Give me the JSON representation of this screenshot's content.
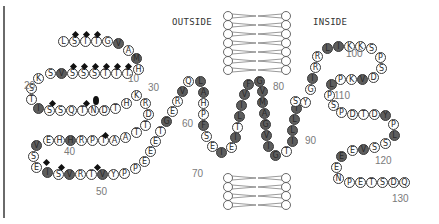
{
  "labels": {
    "outside": "OUTSIDE",
    "inside": "INSIDE"
  },
  "colors": {
    "hydrophobic": "#5e5e5e",
    "residue_fill": "#ffffff",
    "glyco": "#111111",
    "number": "#7a7a7a"
  },
  "numbers": [
    {
      "text": "10",
      "x": 128,
      "y": 79
    },
    {
      "text": "20",
      "x": 24,
      "y": 86
    },
    {
      "text": "30",
      "x": 148,
      "y": 88
    },
    {
      "text": "40",
      "x": 64,
      "y": 152
    },
    {
      "text": "50",
      "x": 96,
      "y": 192
    },
    {
      "text": "60",
      "x": 182,
      "y": 124
    },
    {
      "text": "70",
      "x": 192,
      "y": 174
    },
    {
      "text": "80",
      "x": 273,
      "y": 87
    },
    {
      "text": "90",
      "x": 305,
      "y": 141
    },
    {
      "text": "100",
      "x": 346,
      "y": 54
    },
    {
      "text": "110",
      "x": 334,
      "y": 96
    },
    {
      "text": "120",
      "x": 375,
      "y": 161
    },
    {
      "text": "130",
      "x": 392,
      "y": 199
    }
  ],
  "residues": [
    {
      "aa": "L",
      "x": 63,
      "y": 41,
      "d": 0
    },
    {
      "aa": "S",
      "x": 74,
      "y": 41,
      "d": 0
    },
    {
      "aa": "I",
      "x": 85,
      "y": 41,
      "d": 0
    },
    {
      "aa": "T",
      "x": 96,
      "y": 41,
      "d": 0
    },
    {
      "aa": "G",
      "x": 107,
      "y": 41,
      "d": 0
    },
    {
      "aa": "V",
      "x": 118,
      "y": 43,
      "d": 1
    },
    {
      "aa": "A",
      "x": 128,
      "y": 50,
      "d": 0
    },
    {
      "aa": "M",
      "x": 136,
      "y": 58,
      "d": 1
    },
    {
      "aa": "H",
      "x": 138,
      "y": 69,
      "d": 0
    },
    {
      "aa": "T",
      "x": 127,
      "y": 73,
      "d": 0
    },
    {
      "aa": "T",
      "x": 116,
      "y": 73,
      "d": 0
    },
    {
      "aa": "T",
      "x": 105,
      "y": 73,
      "d": 0
    },
    {
      "aa": "S",
      "x": 94,
      "y": 73,
      "d": 0
    },
    {
      "aa": "S",
      "x": 83,
      "y": 73,
      "d": 0
    },
    {
      "aa": "S",
      "x": 72,
      "y": 73,
      "d": 0
    },
    {
      "aa": "V",
      "x": 61,
      "y": 73,
      "d": 1
    },
    {
      "aa": "S",
      "x": 50,
      "y": 73,
      "d": 0
    },
    {
      "aa": "K",
      "x": 38,
      "y": 78,
      "d": 0
    },
    {
      "aa": "S",
      "x": 31,
      "y": 88,
      "d": 0
    },
    {
      "aa": "T",
      "x": 31,
      "y": 99,
      "d": 0
    },
    {
      "aa": "I",
      "x": 38,
      "y": 108,
      "d": 1
    },
    {
      "aa": "S",
      "x": 49,
      "y": 110,
      "d": 0
    },
    {
      "aa": "S",
      "x": 60,
      "y": 110,
      "d": 0
    },
    {
      "aa": "Q",
      "x": 71,
      "y": 110,
      "d": 0
    },
    {
      "aa": "T",
      "x": 82,
      "y": 110,
      "d": 0
    },
    {
      "aa": "N",
      "x": 93,
      "y": 110,
      "d": 0
    },
    {
      "aa": "D",
      "x": 104,
      "y": 110,
      "d": 0
    },
    {
      "aa": "T",
      "x": 115,
      "y": 108,
      "d": 0
    },
    {
      "aa": "H",
      "x": 126,
      "y": 103,
      "d": 0
    },
    {
      "aa": "K",
      "x": 136,
      "y": 95,
      "d": 0
    },
    {
      "aa": "R",
      "x": 145,
      "y": 103,
      "d": 0
    },
    {
      "aa": "D",
      "x": 148,
      "y": 114,
      "d": 0
    },
    {
      "aa": "T",
      "x": 145,
      "y": 125,
      "d": 0
    },
    {
      "aa": "T",
      "x": 136,
      "y": 132,
      "d": 0
    },
    {
      "aa": "A",
      "x": 125,
      "y": 137,
      "d": 0
    },
    {
      "aa": "A",
      "x": 114,
      "y": 140,
      "d": 0
    },
    {
      "aa": "T",
      "x": 103,
      "y": 140,
      "d": 0
    },
    {
      "aa": "P",
      "x": 92,
      "y": 140,
      "d": 0
    },
    {
      "aa": "R",
      "x": 81,
      "y": 140,
      "d": 0
    },
    {
      "aa": "H",
      "x": 70,
      "y": 140,
      "d": 1
    },
    {
      "aa": "H",
      "x": 59,
      "y": 140,
      "d": 0
    },
    {
      "aa": "E",
      "x": 48,
      "y": 140,
      "d": 0
    },
    {
      "aa": "V",
      "x": 36,
      "y": 145,
      "d": 1
    },
    {
      "aa": "S",
      "x": 33,
      "y": 156,
      "d": 0
    },
    {
      "aa": "E",
      "x": 36,
      "y": 167,
      "d": 0
    },
    {
      "aa": "I",
      "x": 47,
      "y": 172,
      "d": 1
    },
    {
      "aa": "S",
      "x": 58,
      "y": 174,
      "d": 0
    },
    {
      "aa": "V",
      "x": 69,
      "y": 174,
      "d": 1
    },
    {
      "aa": "R",
      "x": 80,
      "y": 174,
      "d": 0
    },
    {
      "aa": "T",
      "x": 91,
      "y": 174,
      "d": 0
    },
    {
      "aa": "V",
      "x": 102,
      "y": 174,
      "d": 1
    },
    {
      "aa": "Y",
      "x": 113,
      "y": 174,
      "d": 0
    },
    {
      "aa": "P",
      "x": 124,
      "y": 173,
      "d": 0
    },
    {
      "aa": "P",
      "x": 135,
      "y": 168,
      "d": 0
    },
    {
      "aa": "E",
      "x": 144,
      "y": 161,
      "d": 0
    },
    {
      "aa": "E",
      "x": 150,
      "y": 151,
      "d": 0
    },
    {
      "aa": "E",
      "x": 155,
      "y": 141,
      "d": 0
    },
    {
      "aa": "T",
      "x": 160,
      "y": 131,
      "d": 0
    },
    {
      "aa": "G",
      "x": 166,
      "y": 121,
      "d": 1
    },
    {
      "aa": "E",
      "x": 172,
      "y": 111,
      "d": 0
    },
    {
      "aa": "R",
      "x": 177,
      "y": 101,
      "d": 0
    },
    {
      "aa": "V",
      "x": 182,
      "y": 91,
      "d": 1
    },
    {
      "aa": "Q",
      "x": 188,
      "y": 81,
      "d": 0
    },
    {
      "aa": "L",
      "x": 200,
      "y": 81,
      "d": 1
    },
    {
      "aa": "A",
      "x": 203,
      "y": 92,
      "d": 1
    },
    {
      "aa": "H",
      "x": 203,
      "y": 103,
      "d": 0
    },
    {
      "aa": "P",
      "x": 203,
      "y": 114,
      "d": 0
    },
    {
      "aa": "F",
      "x": 203,
      "y": 125,
      "d": 1
    },
    {
      "aa": "S",
      "x": 206,
      "y": 136,
      "d": 0
    },
    {
      "aa": "E",
      "x": 212,
      "y": 146,
      "d": 0
    },
    {
      "aa": "I",
      "x": 221,
      "y": 152,
      "d": 1
    },
    {
      "aa": "E",
      "x": 231,
      "y": 147,
      "d": 0
    },
    {
      "aa": "I",
      "x": 235,
      "y": 137,
      "d": 1
    },
    {
      "aa": "T",
      "x": 237,
      "y": 127,
      "d": 0
    },
    {
      "aa": "L",
      "x": 239,
      "y": 116,
      "d": 1
    },
    {
      "aa": "I",
      "x": 241,
      "y": 105,
      "d": 1
    },
    {
      "aa": "V",
      "x": 244,
      "y": 94,
      "d": 1
    },
    {
      "aa": "F",
      "x": 248,
      "y": 84,
      "d": 1
    },
    {
      "aa": "G",
      "x": 259,
      "y": 81,
      "d": 1
    },
    {
      "aa": "V",
      "x": 262,
      "y": 91,
      "d": 1
    },
    {
      "aa": "M",
      "x": 262,
      "y": 102,
      "d": 1
    },
    {
      "aa": "A",
      "x": 264,
      "y": 113,
      "d": 1
    },
    {
      "aa": "G",
      "x": 265,
      "y": 124,
      "d": 1
    },
    {
      "aa": "V",
      "x": 266,
      "y": 135,
      "d": 1
    },
    {
      "aa": "I",
      "x": 268,
      "y": 146,
      "d": 1
    },
    {
      "aa": "G",
      "x": 275,
      "y": 155,
      "d": 1
    },
    {
      "aa": "T",
      "x": 286,
      "y": 151,
      "d": 0
    },
    {
      "aa": "I",
      "x": 292,
      "y": 141,
      "d": 1
    },
    {
      "aa": "L",
      "x": 292,
      "y": 130,
      "d": 1
    },
    {
      "aa": "L",
      "x": 294,
      "y": 119,
      "d": 1
    },
    {
      "aa": "I",
      "x": 296,
      "y": 108,
      "d": 1
    },
    {
      "aa": "Y",
      "x": 305,
      "y": 102,
      "d": 0
    },
    {
      "aa": "S",
      "x": 295,
      "y": 101,
      "d": 0
    },
    {
      "aa": "G",
      "x": 310,
      "y": 89,
      "d": 0
    },
    {
      "aa": "I",
      "x": 312,
      "y": 78,
      "d": 1
    },
    {
      "aa": "R",
      "x": 315,
      "y": 67,
      "d": 0
    },
    {
      "aa": "R",
      "x": 317,
      "y": 56,
      "d": 0
    },
    {
      "aa": "L",
      "x": 327,
      "y": 48,
      "d": 1
    },
    {
      "aa": "I",
      "x": 338,
      "y": 46,
      "d": 1
    },
    {
      "aa": "K",
      "x": 349,
      "y": 46,
      "d": 0
    },
    {
      "aa": "K",
      "x": 360,
      "y": 46,
      "d": 0
    },
    {
      "aa": "S",
      "x": 371,
      "y": 48,
      "d": 0
    },
    {
      "aa": "P",
      "x": 380,
      "y": 57,
      "d": 0
    },
    {
      "aa": "S",
      "x": 381,
      "y": 68,
      "d": 0
    },
    {
      "aa": "D",
      "x": 373,
      "y": 77,
      "d": 0
    },
    {
      "aa": "V",
      "x": 362,
      "y": 79,
      "d": 1
    },
    {
      "aa": "K",
      "x": 351,
      "y": 79,
      "d": 0
    },
    {
      "aa": "P",
      "x": 340,
      "y": 79,
      "d": 0
    },
    {
      "aa": "L",
      "x": 331,
      "y": 84,
      "d": 1
    },
    {
      "aa": "P",
      "x": 329,
      "y": 95,
      "d": 0
    },
    {
      "aa": "S",
      "x": 333,
      "y": 105,
      "d": 0
    },
    {
      "aa": "P",
      "x": 341,
      "y": 112,
      "d": 0
    },
    {
      "aa": "D",
      "x": 352,
      "y": 114,
      "d": 0
    },
    {
      "aa": "T",
      "x": 363,
      "y": 114,
      "d": 0
    },
    {
      "aa": "D",
      "x": 374,
      "y": 114,
      "d": 0
    },
    {
      "aa": "Y",
      "x": 385,
      "y": 115,
      "d": 1
    },
    {
      "aa": "P",
      "x": 393,
      "y": 124,
      "d": 0
    },
    {
      "aa": "L",
      "x": 394,
      "y": 135,
      "d": 1
    },
    {
      "aa": "S",
      "x": 385,
      "y": 143,
      "d": 0
    },
    {
      "aa": "S",
      "x": 374,
      "y": 147,
      "d": 0
    },
    {
      "aa": "V",
      "x": 363,
      "y": 149,
      "d": 1
    },
    {
      "aa": "E",
      "x": 352,
      "y": 150,
      "d": 0
    },
    {
      "aa": "E",
      "x": 341,
      "y": 156,
      "d": 1
    },
    {
      "aa": "E",
      "x": 336,
      "y": 167,
      "d": 0
    },
    {
      "aa": "N",
      "x": 338,
      "y": 178,
      "d": 0
    },
    {
      "aa": "P",
      "x": 349,
      "y": 182,
      "d": 0
    },
    {
      "aa": "E",
      "x": 360,
      "y": 182,
      "d": 0
    },
    {
      "aa": "T",
      "x": 371,
      "y": 182,
      "d": 0
    },
    {
      "aa": "S",
      "x": 382,
      "y": 182,
      "d": 0
    },
    {
      "aa": "D",
      "x": 393,
      "y": 182,
      "d": 0
    },
    {
      "aa": "Q",
      "x": 404,
      "y": 182,
      "d": 0
    }
  ],
  "glyco_diamonds": [
    {
      "x": 75,
      "y": 34
    },
    {
      "x": 86,
      "y": 34
    },
    {
      "x": 97,
      "y": 34
    },
    {
      "x": 73,
      "y": 66
    },
    {
      "x": 84,
      "y": 66
    },
    {
      "x": 95,
      "y": 66
    },
    {
      "x": 106,
      "y": 66
    },
    {
      "x": 117,
      "y": 66
    },
    {
      "x": 128,
      "y": 66
    },
    {
      "x": 52,
      "y": 103
    },
    {
      "x": 86,
      "y": 103
    },
    {
      "x": 105,
      "y": 135
    },
    {
      "x": 46,
      "y": 162
    },
    {
      "x": 61,
      "y": 167
    },
    {
      "x": 97,
      "y": 167
    }
  ],
  "glyco_blobs": [
    {
      "x": 96,
      "y": 100
    }
  ]
}
